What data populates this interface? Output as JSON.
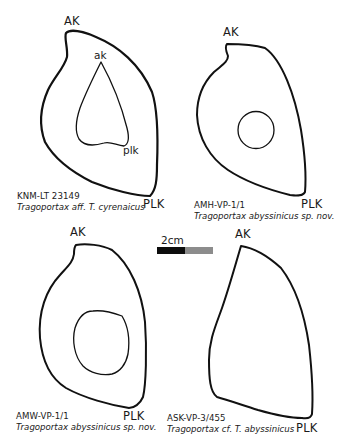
{
  "figure": {
    "scale_bar": {
      "label": "2cm",
      "segment_colors": [
        "#0d0d0d",
        "#8c8c8c"
      ]
    },
    "panels": [
      {
        "id": "top-left",
        "outer_top_label": "AK",
        "outer_bottom_label": "PLK",
        "inner_top_label": "ak",
        "inner_bottom_label": "plk",
        "specimen": "KNM-LT 23149",
        "taxon": "Tragoportax aff. T. cyrenaicus"
      },
      {
        "id": "top-right",
        "outer_top_label": "AK",
        "outer_bottom_label": "PLK",
        "specimen": "AMH-VP-1/1",
        "taxon": "Tragoportax abyssinicus sp. nov."
      },
      {
        "id": "bottom-left",
        "outer_top_label": "AK",
        "outer_bottom_label": "PLK",
        "specimen": "AMW-VP-1/1",
        "taxon": "Tragoportax abyssinicus sp. nov."
      },
      {
        "id": "bottom-right",
        "outer_top_label": "AK",
        "outer_bottom_label": "PLK",
        "specimen": "ASK-VP-3/455",
        "taxon": "Tragoportax cf. T. abyssinicus"
      }
    ],
    "colors": {
      "line": "#111111",
      "background": "#ffffff"
    }
  }
}
